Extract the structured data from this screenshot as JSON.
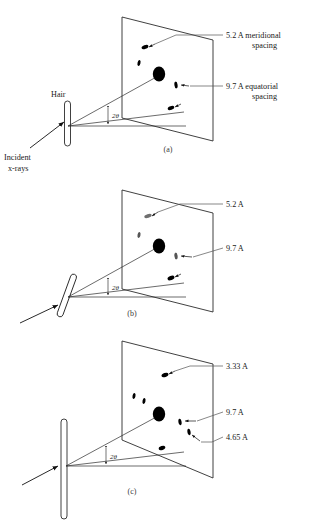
{
  "figure": {
    "title_caption": "",
    "panels": [
      {
        "id": "a",
        "caption": "(a)",
        "sample_label": "Hair",
        "beam_label_line1": "Incident",
        "beam_label_line2": "x-rays",
        "angle_label": "2θ",
        "labels": [
          {
            "line1": "5.2 A  meridional",
            "line2": "spacing"
          },
          {
            "line1": "9.7 A  equatorial",
            "line2": "spacing"
          }
        ]
      },
      {
        "id": "b",
        "caption": "(b)",
        "sample_label": "",
        "beam_label_line1": "",
        "beam_label_line2": "",
        "angle_label": "2θ",
        "labels": [
          {
            "line1": "5.2 A",
            "line2": ""
          },
          {
            "line1": "9.7 A",
            "line2": ""
          }
        ]
      },
      {
        "id": "c",
        "caption": "(c)",
        "sample_label": "",
        "beam_label_line1": "",
        "beam_label_line2": "",
        "angle_label": "2θ",
        "labels": [
          {
            "line1": "3.33 A",
            "line2": ""
          },
          {
            "line1": "9.7 A",
            "line2": ""
          },
          {
            "line1": "4.65 A",
            "line2": ""
          }
        ]
      }
    ],
    "colors": {
      "ink": "#1a1a1a",
      "line": "#2b2b2b",
      "leader": "#555555",
      "spot": "#000000",
      "background": "#ffffff"
    }
  }
}
